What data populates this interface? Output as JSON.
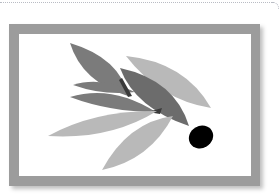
{
  "artwork": {
    "subject": "olive branch illustration",
    "frame_color": "#9c9c9c",
    "canvas_color": "#ffffff",
    "leaf_dark_color": "#7b7b7b",
    "leaf_darker_color": "#6c6c6c",
    "leaf_light_color": "#b9b9b9",
    "olive_color": "#000000",
    "border_dot_color": "#b9bcc4"
  }
}
